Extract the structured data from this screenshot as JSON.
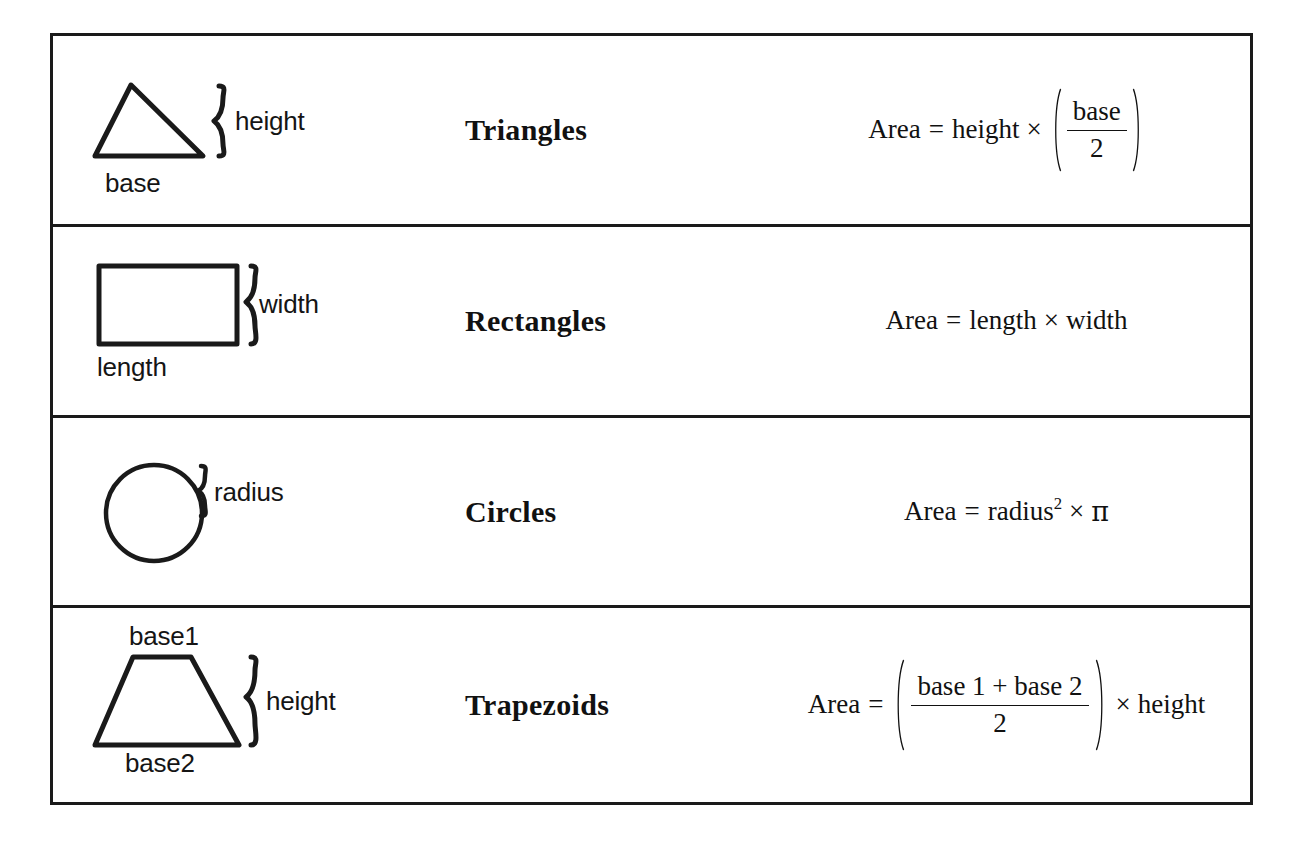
{
  "document": {
    "title": "Area Formulas Reference Table",
    "border_color": "#1a1a1a",
    "background": "#ffffff",
    "text_color": "#111111"
  },
  "table": {
    "rows": [
      {
        "shape": "Triangles",
        "figure": "triangle-diagram",
        "labels": {
          "base": "base",
          "height": "height"
        },
        "formula": {
          "lhs": "Area",
          "equals": "=",
          "term1": "height",
          "times": "×",
          "numerator": "base",
          "denominator": "2"
        },
        "formula_text": "Area = height × (base / 2)"
      },
      {
        "shape": "Rectangles",
        "figure": "rectangle-diagram",
        "labels": {
          "length": "length",
          "width": "width"
        },
        "formula": {
          "lhs": "Area",
          "equals": "=",
          "term1": "length",
          "times": "×",
          "term2": "width"
        },
        "formula_text": "Area = length × width"
      },
      {
        "shape": "Circles",
        "figure": "circle-diagram",
        "labels": {
          "radius": "radius"
        },
        "formula": {
          "lhs": "Area",
          "equals": "=",
          "term1": "radius",
          "exponent": "2",
          "times": "×",
          "term2": "π"
        },
        "formula_text": "Area = radius² × π"
      },
      {
        "shape": "Trapezoids",
        "figure": "trapezoid-diagram",
        "labels": {
          "base1": "base1",
          "base2": "base2",
          "height": "height"
        },
        "formula": {
          "lhs": "Area",
          "equals": "=",
          "numerator": "base 1 + base 2",
          "denominator": "2",
          "times": "×",
          "term2": "height"
        },
        "formula_text": "Area = ((base 1 + base 2) / 2) × height"
      }
    ]
  }
}
